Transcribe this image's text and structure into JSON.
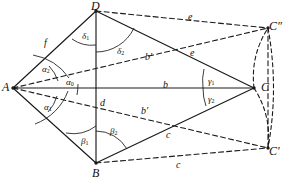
{
  "figure": {
    "stroke_color": "#1a1a1a",
    "background_color": "#ffffff",
    "vertices": [
      {
        "id": "A",
        "label": "A",
        "x": 13,
        "y": 88,
        "label_x": 2,
        "label_y": 81
      },
      {
        "id": "B",
        "label": "B",
        "x": 96,
        "y": 163,
        "label_x": 92,
        "label_y": 167
      },
      {
        "id": "C",
        "label": "C",
        "x": 254,
        "y": 88,
        "label_x": 261,
        "label_y": 81
      },
      {
        "id": "D",
        "label": "D",
        "x": 96,
        "y": 11,
        "label_x": 91,
        "label_y": 0
      },
      {
        "id": "C2",
        "label": "C″",
        "x": 268,
        "y": 28,
        "label_x": 269,
        "label_y": 20
      },
      {
        "id": "C1",
        "label": "C′",
        "x": 268,
        "y": 148,
        "label_x": 269,
        "label_y": 145
      }
    ],
    "solid_edges": [
      {
        "name": "A-D",
        "from": "A",
        "to": "D"
      },
      {
        "name": "A-B",
        "from": "A",
        "to": "B"
      },
      {
        "name": "D-B",
        "from": "D",
        "to": "B"
      },
      {
        "name": "A-C",
        "from": "A",
        "to": "C"
      },
      {
        "name": "D-C",
        "from": "D",
        "to": "C"
      },
      {
        "name": "B-C",
        "from": "B",
        "to": "C"
      }
    ],
    "dashed_edges": [
      {
        "name": "A-C-double-prime",
        "from": "A",
        "to": "C2"
      },
      {
        "name": "A-C-prime",
        "from": "A",
        "to": "C1"
      },
      {
        "name": "D-C-double-prime",
        "from": "D",
        "to": "C2"
      },
      {
        "name": "B-C-prime",
        "from": "B",
        "to": "C1"
      },
      {
        "name": "C-double-prime-to-C-prime",
        "from": "C2",
        "to": "C1"
      }
    ],
    "dashed_arcs": [
      {
        "name": "arc-C-to-C-double-prime",
        "from": "C",
        "to": "C2"
      },
      {
        "name": "arc-C-to-C-prime",
        "from": "C",
        "to": "C1"
      },
      {
        "name": "arc-outer-right",
        "from": "C2",
        "to": "C1"
      }
    ],
    "side_labels": [
      {
        "name": "side-f",
        "text": "f",
        "x": 44,
        "y": 38
      },
      {
        "name": "side-d",
        "text": "d",
        "x": 100,
        "y": 98
      },
      {
        "name": "side-b",
        "text": "b",
        "x": 163,
        "y": 80
      },
      {
        "name": "side-b-prime-upper",
        "text": "b′",
        "x": 145,
        "y": 52
      },
      {
        "name": "side-b-prime-lower",
        "text": "b′",
        "x": 141,
        "y": 106
      },
      {
        "name": "side-e-inner",
        "text": "e",
        "x": 190,
        "y": 48
      },
      {
        "name": "side-e-outer",
        "text": "e",
        "x": 188,
        "y": 12
      },
      {
        "name": "side-c-inner",
        "text": "c",
        "x": 166,
        "y": 130
      },
      {
        "name": "side-c-outer",
        "text": "c",
        "x": 176,
        "y": 160
      }
    ],
    "angle_labels": [
      {
        "name": "angle-alpha-2",
        "text": "α",
        "sub": "2",
        "x": 42,
        "y": 65
      },
      {
        "name": "angle-alpha-0",
        "text": "α",
        "sub": "0",
        "x": 66,
        "y": 78
      },
      {
        "name": "angle-alpha-1",
        "text": "α",
        "sub": "1",
        "x": 44,
        "y": 103
      },
      {
        "name": "angle-delta-1",
        "text": "δ",
        "sub": "1",
        "x": 82,
        "y": 32
      },
      {
        "name": "angle-delta-2",
        "text": "δ",
        "sub": "2",
        "x": 117,
        "y": 47
      },
      {
        "name": "angle-beta-1",
        "text": "β",
        "sub": "1",
        "x": 81,
        "y": 137
      },
      {
        "name": "angle-beta-2",
        "text": "β",
        "sub": "2",
        "x": 110,
        "y": 127
      },
      {
        "name": "angle-gamma-1",
        "text": "γ",
        "sub": "1",
        "x": 208,
        "y": 77
      },
      {
        "name": "angle-gamma-2",
        "text": "γ",
        "sub": "2",
        "x": 208,
        "y": 95
      }
    ],
    "angle_arcs": [
      {
        "name": "arc-alpha-2",
        "d": "M 49 66 A 38 38 0 0 1 58 81"
      },
      {
        "name": "arc-alpha-2b",
        "d": "M 33 55 A 56 56 0 0 1 69 78"
      },
      {
        "name": "arc-alpha-1",
        "d": "M 57 96 A 38 38 0 0 1 48 112"
      },
      {
        "name": "arc-alpha-1b",
        "d": "M 68 91 A 56 56 0 0 1 35 124"
      },
      {
        "name": "arc-alpha-0",
        "d": "M 78 84 A 66 66 0 0 1 77 95"
      },
      {
        "name": "arc-delta-1",
        "d": "M 72 39 A 34 34 0 0 0 96 45"
      },
      {
        "name": "arc-delta-2",
        "d": "M 96 52 A 42 42 0 0 0 134 28"
      },
      {
        "name": "arc-beta-1",
        "d": "M 66 133 A 38 38 0 0 0 96 126"
      },
      {
        "name": "arc-beta-2",
        "d": "M 96 131 A 36 36 0 0 1 127 149"
      },
      {
        "name": "arc-gamma-1",
        "d": "M 204 69 A 52 52 0 0 0 203 88"
      },
      {
        "name": "arc-gamma-2",
        "d": "M 203 88 A 52 52 0 0 0 206 106"
      }
    ]
  }
}
